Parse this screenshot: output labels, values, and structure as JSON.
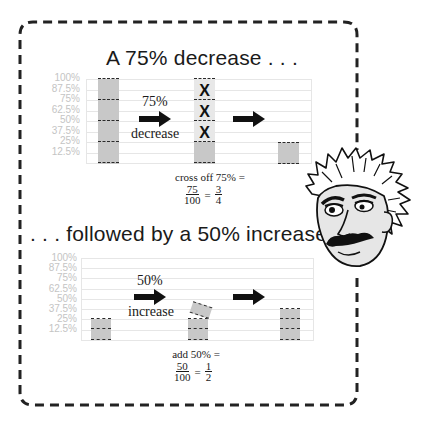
{
  "top_section": {
    "heading": "A 75% decrease . . .",
    "y_axis_labels": [
      "100%",
      "87.5%",
      "75%",
      "62.5%",
      "50%",
      "37.5%",
      "25%",
      "12.5%"
    ],
    "arrow_label_top": "75%",
    "arrow_label_bottom": "decrease",
    "cross_mark": "X",
    "caption": "cross off 75% =",
    "fraction_left": {
      "numerator": "75",
      "denominator": "100"
    },
    "equals": "=",
    "fraction_right": {
      "numerator": "3",
      "denominator": "4"
    }
  },
  "bottom_section": {
    "heading": ". . . followed by a 50% increase.",
    "y_axis_labels": [
      "100%",
      "87.5%",
      "75%",
      "62.5%",
      "50%",
      "37.5%",
      "25%",
      "12.5%"
    ],
    "arrow_label_top": "50%",
    "arrow_label_bottom": "increase",
    "caption": "add 50% =",
    "fraction_left": {
      "numerator": "50",
      "denominator": "100"
    },
    "equals": "=",
    "fraction_right": {
      "numerator": "1",
      "denominator": "2"
    }
  },
  "colors": {
    "bar_fill": "#c8c8c8",
    "grid": "#e6e6e6",
    "axis_label": "#c4c4c4",
    "border": "#222222",
    "arrow": "#111111"
  },
  "icons": {
    "arrow": "right-arrow-icon",
    "character": "einstein-caricature"
  }
}
